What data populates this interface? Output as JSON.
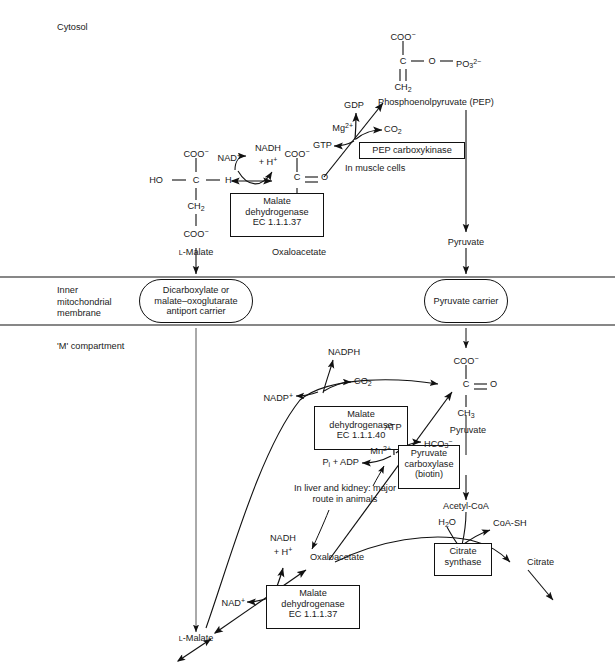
{
  "diagram": {
    "type": "biochemical-pathway"
  },
  "compartments": {
    "cytosol": "Cytosol",
    "membrane": "Inner\nmitochondrial\nmembrane",
    "membrane_line1": "Inner",
    "membrane_line2": "mitochondrial",
    "membrane_line3": "membrane",
    "matrix": "'M' compartment"
  },
  "carriers": [
    {
      "name": "dicarboxylate-carrier",
      "line1": "Dicarboxylate or",
      "line2": "malate–oxoglutarate",
      "line3": "antiport carrier"
    },
    {
      "name": "pyruvate-carrier",
      "line1": "Pyruvate carrier"
    }
  ],
  "enzymes": [
    {
      "name": "malate-dehydrogenase-cytosolic",
      "line1": "Malate",
      "line2": "dehydrogenase",
      "line3": "EC 1.1.1.37"
    },
    {
      "name": "pep-carboxykinase",
      "line1": "PEP carboxykinase"
    },
    {
      "name": "malate-dehydrogenase-nadp",
      "line1": "Malate",
      "line2": "dehydrogenase",
      "line3": "EC 1.1.1.40"
    },
    {
      "name": "pyruvate-carboxylase",
      "line1": "Pyruvate",
      "line2": "carboxylase",
      "line3": "(biotin)"
    },
    {
      "name": "citrate-synthase",
      "line1": "Citrate",
      "line2": "synthase"
    },
    {
      "name": "malate-dehydrogenase-matrix",
      "line1": "Malate",
      "line2": "dehydrogenase",
      "line3": "EC 1.1.1.37"
    }
  ],
  "metabolites": {
    "l_malate_cyt": "L-Malate",
    "l_malate_mat": "L-Malate",
    "oxaloacetate_cyt": "Oxaloacetate",
    "oxaloacetate_mat": "Oxaloacetate",
    "pep": "Phosphoenolpyruvate (PEP)",
    "pyruvate_cyt": "Pyruvate",
    "pyruvate_mat": "Pyruvate",
    "acetyl_coa": "Acetyl-CoA",
    "citrate": "Citrate",
    "coa_sh": "CoA-SH"
  },
  "cofactors": {
    "nad_plus_cyt": "NAD",
    "nadh_cyt_l1": "NADH",
    "nadh_cyt_l2": "+ H",
    "gdp": "GDP",
    "gtp": "GTP",
    "mg": "Mg",
    "co2_cyt": "CO",
    "nadph": "NADPH",
    "nadp_plus": "NADP",
    "co2_mat": "CO",
    "atp": "ATP",
    "mn": "Mn",
    "hco3": "HCO",
    "pi_adp": "P",
    "pi_adp_rest": " + ADP",
    "h2o": "H",
    "h2o_rest": "O",
    "nad_plus_mat": "NAD",
    "nadh_mat_l1": "NADH",
    "nadh_mat_l2": "+ H"
  },
  "annotations": {
    "in_muscle_cells": "In muscle cells",
    "liver_kidney_l1": "In liver and kidney: major",
    "liver_kidney_l2": "route in animals"
  },
  "structures": {
    "l_malate": {
      "top": "COO",
      "mid_left": "HO",
      "mid_center": "C",
      "mid_right": "H",
      "ch2": "CH",
      "bottom": "COO"
    },
    "oxaloacetate_cyt": {
      "top": "COO",
      "mid": "C",
      "mid_o": "O",
      "ch2": "CH",
      "bottom": "COO"
    },
    "pep": {
      "top": "COO",
      "c": "C",
      "o": "O",
      "po3": "PO",
      "ch2": "CH"
    },
    "pyruvate": {
      "top": "COO",
      "c": "C",
      "o": "O",
      "ch3": "CH"
    }
  },
  "colors": {
    "stroke": "#111111",
    "background": "#ffffff",
    "text": "#1a1a1a"
  }
}
